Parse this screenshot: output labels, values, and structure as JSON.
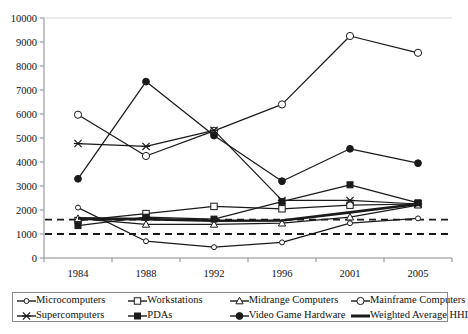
{
  "chart_data": {
    "type": "line",
    "title": "",
    "subtitle": "",
    "xlabel": "",
    "ylabel": "",
    "categories": [
      "1984",
      "1988",
      "1992",
      "1996",
      "2001",
      "2005"
    ],
    "ylim": [
      0,
      10000
    ],
    "ytick_labels": [
      "0",
      "1000",
      "2000",
      "3000",
      "4000",
      "5000",
      "6000",
      "7000",
      "8000",
      "9000",
      "10000"
    ],
    "ytick_values": [
      0,
      1000,
      2000,
      3000,
      4000,
      5000,
      6000,
      7000,
      8000,
      9000,
      10000
    ],
    "grid": false,
    "legend_position": "bottom",
    "series": [
      {
        "name": "Microcomputers",
        "marker": "circle-small-open",
        "values": [
          2100,
          700,
          450,
          650,
          1450,
          1650
        ]
      },
      {
        "name": "Workstations",
        "marker": "square-open",
        "values": [
          1560,
          1850,
          2150,
          2050,
          2200,
          2250
        ]
      },
      {
        "name": "Midrange Computers",
        "marker": "triangle-open",
        "values": [
          1640,
          1400,
          1400,
          1450,
          1700,
          2200
        ]
      },
      {
        "name": "Mainframe Computers",
        "marker": "circle-open",
        "values": [
          5970,
          4250,
          5300,
          6400,
          9250,
          8550
        ]
      },
      {
        "name": "Supercomputers",
        "marker": "star-x",
        "values": [
          4770,
          4650,
          5320,
          2400,
          2400,
          2250
        ]
      },
      {
        "name": "PDAs",
        "marker": "square-filled",
        "values": [
          1350,
          1700,
          1620,
          2350,
          3050,
          2300
        ]
      },
      {
        "name": "Video Game Hardware",
        "marker": "circle-filled",
        "values": [
          3300,
          7350,
          5100,
          3200,
          4550,
          3950
        ]
      },
      {
        "name": "Weighted Average HHI",
        "marker": "thick-line",
        "values": [
          1650,
          1620,
          1550,
          1560,
          1900,
          2250
        ]
      }
    ],
    "reference_lines": [
      {
        "value": 1600,
        "style": "dashed"
      },
      {
        "value": 1000,
        "style": "dashed"
      }
    ]
  },
  "legend": {
    "row1": [
      {
        "label": "Microcomputers",
        "icon": "marker-circle-small-open-icon"
      },
      {
        "label": "Workstations",
        "icon": "marker-square-open-icon"
      },
      {
        "label": "Midrange Computers",
        "icon": "marker-triangle-open-icon"
      },
      {
        "label": "Mainframe Computers",
        "icon": "marker-circle-open-icon"
      }
    ],
    "row2": [
      {
        "label": "Supercomputers",
        "icon": "marker-star-x-icon"
      },
      {
        "label": "PDAs",
        "icon": "marker-square-filled-icon"
      },
      {
        "label": "Video Game Hardware",
        "icon": "marker-circle-filled-icon"
      },
      {
        "label": "Weighted Average HHI",
        "icon": "marker-thick-line-icon"
      }
    ]
  },
  "colors": {
    "line": "#1a1a1a",
    "axis": "#8a8a8a",
    "text": "#111111",
    "background": "#ffffff",
    "legend_border": "#8a8a8a"
  }
}
